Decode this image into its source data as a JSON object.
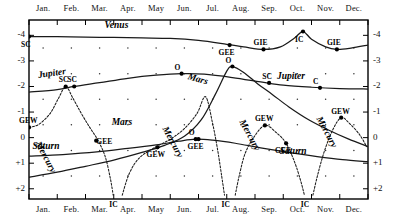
{
  "chart_data": {
    "type": "line",
    "title": "",
    "xlabel": "",
    "ylabel": "Magnitude",
    "ylim": [
      -4.6,
      2.4
    ],
    "yticks": [
      "-4",
      "-3",
      "-2",
      "-1",
      "0",
      "+1",
      "+2"
    ],
    "ytick_values": [
      -4,
      -3,
      -2,
      -1,
      0,
      1,
      2
    ],
    "grid": "dot-matrix",
    "legend": "inline-curve-labels",
    "x": [
      "Jan.",
      "Feb.",
      "Mar.",
      "Apr.",
      "May",
      "Jun.",
      "Jul.",
      "Aug.",
      "Sep.",
      "Oct.",
      "Nov.",
      "Dec."
    ],
    "series": [
      {
        "name": "Venus",
        "style": "solid",
        "points": [
          {
            "month": 1.0,
            "mag": -3.95
          },
          {
            "month": 2.0,
            "mag": -3.95
          },
          {
            "month": 3.0,
            "mag": -3.93
          },
          {
            "month": 4.0,
            "mag": -3.92
          },
          {
            "month": 5.0,
            "mag": -3.9
          },
          {
            "month": 6.0,
            "mag": -3.88
          },
          {
            "month": 7.0,
            "mag": -3.8
          },
          {
            "month": 8.0,
            "mag": -3.65
          },
          {
            "month": 8.6,
            "mag": -3.55
          },
          {
            "month": 9.3,
            "mag": -3.45
          },
          {
            "month": 9.9,
            "mag": -3.55
          },
          {
            "month": 10.4,
            "mag": -3.9
          },
          {
            "month": 10.7,
            "mag": -4.15
          },
          {
            "month": 11.0,
            "mag": -3.85
          },
          {
            "month": 11.5,
            "mag": -3.55
          },
          {
            "month": 11.9,
            "mag": -3.45
          },
          {
            "month": 12.4,
            "mag": -3.5
          },
          {
            "month": 13.0,
            "mag": -3.62
          }
        ],
        "events": [
          {
            "label": "SC",
            "month": 1.0,
            "mag": -3.95,
            "pos": "below"
          },
          {
            "label": "GEE",
            "month": 8.1,
            "mag": -3.62,
            "pos": "below"
          },
          {
            "label": "GIE",
            "month": 9.3,
            "mag": -3.45,
            "pos": "above"
          },
          {
            "label": "IC",
            "month": 10.7,
            "mag": -4.15,
            "pos": "below"
          },
          {
            "label": "GIE",
            "month": 11.9,
            "mag": -3.45,
            "pos": "above"
          }
        ]
      },
      {
        "name": "Jupiter",
        "style": "solid",
        "points": [
          {
            "month": 1.0,
            "mag": -1.78
          },
          {
            "month": 2.0,
            "mag": -1.88
          },
          {
            "month": 2.6,
            "mag": -2.0
          },
          {
            "month": 3.5,
            "mag": -2.15
          },
          {
            "month": 4.5,
            "mag": -2.32
          },
          {
            "month": 5.5,
            "mag": -2.44
          },
          {
            "month": 6.4,
            "mag": -2.5
          },
          {
            "month": 7.2,
            "mag": -2.48
          },
          {
            "month": 8.2,
            "mag": -2.35
          },
          {
            "month": 9.2,
            "mag": -2.18
          },
          {
            "month": 10.0,
            "mag": -2.05
          },
          {
            "month": 11.0,
            "mag": -1.97
          },
          {
            "month": 12.0,
            "mag": -1.92
          },
          {
            "month": 13.0,
            "mag": -1.9
          }
        ],
        "events": [
          {
            "label": "SC",
            "month": 2.6,
            "mag": -2.0,
            "pos": "above"
          },
          {
            "label": "O",
            "month": 6.4,
            "mag": -2.5,
            "pos": "above"
          },
          {
            "label": "SC",
            "month": 9.5,
            "mag": -2.14,
            "pos": "above"
          },
          {
            "label": "C",
            "month": 11.3,
            "mag": -1.95,
            "pos": "above"
          }
        ]
      },
      {
        "name": "Mars",
        "style": "solid",
        "points": [
          {
            "month": 1.0,
            "mag": 1.55
          },
          {
            "month": 2.0,
            "mag": 1.35
          },
          {
            "month": 3.0,
            "mag": 1.12
          },
          {
            "month": 4.0,
            "mag": 0.88
          },
          {
            "month": 5.0,
            "mag": 0.58
          },
          {
            "month": 5.8,
            "mag": 0.3
          },
          {
            "month": 6.5,
            "mag": -0.05
          },
          {
            "month": 7.1,
            "mag": -0.7
          },
          {
            "month": 7.6,
            "mag": -1.7
          },
          {
            "month": 8.0,
            "mag": -2.6
          },
          {
            "month": 8.2,
            "mag": -2.78
          },
          {
            "month": 8.6,
            "mag": -2.55
          },
          {
            "month": 9.1,
            "mag": -2.1
          },
          {
            "month": 9.6,
            "mag": -1.7
          },
          {
            "month": 10.2,
            "mag": -1.2
          },
          {
            "month": 10.9,
            "mag": -0.7
          },
          {
            "month": 11.6,
            "mag": -0.3
          },
          {
            "month": 12.3,
            "mag": 0.05
          },
          {
            "month": 13.0,
            "mag": 0.35
          }
        ],
        "events": [
          {
            "label": "O",
            "month": 8.2,
            "mag": -2.78,
            "pos": "above"
          }
        ]
      },
      {
        "name": "Saturn",
        "style": "solid",
        "points": [
          {
            "month": 1.0,
            "mag": 0.72
          },
          {
            "month": 2.2,
            "mag": 0.66
          },
          {
            "month": 3.4,
            "mag": 0.56
          },
          {
            "month": 4.5,
            "mag": 0.42
          },
          {
            "month": 5.5,
            "mag": 0.28
          },
          {
            "month": 6.3,
            "mag": 0.14
          },
          {
            "month": 6.9,
            "mag": 0.06
          },
          {
            "month": 7.5,
            "mag": 0.1
          },
          {
            "month": 8.3,
            "mag": 0.22
          },
          {
            "month": 9.2,
            "mag": 0.4
          },
          {
            "month": 10.2,
            "mag": 0.58
          },
          {
            "month": 11.2,
            "mag": 0.74
          },
          {
            "month": 12.1,
            "mag": 0.86
          },
          {
            "month": 13.0,
            "mag": 0.94
          }
        ],
        "events": [
          {
            "label": "O",
            "month": 6.9,
            "mag": 0.06,
            "pos": "above"
          }
        ]
      },
      {
        "name": "Mercury",
        "style": "dotted",
        "branches": [
          {
            "points": [
              {
                "month": 1.0,
                "mag": -0.4
              },
              {
                "month": 1.35,
                "mag": -0.52
              },
              {
                "month": 1.75,
                "mag": -0.95
              },
              {
                "month": 2.05,
                "mag": -1.55
              },
              {
                "month": 2.3,
                "mag": -2.0
              },
              {
                "month": 2.55,
                "mag": -1.55
              },
              {
                "month": 2.85,
                "mag": -0.95
              },
              {
                "month": 3.15,
                "mag": -0.4
              },
              {
                "month": 3.45,
                "mag": 0.12
              },
              {
                "month": 3.7,
                "mag": 0.75
              },
              {
                "month": 3.88,
                "mag": 1.6
              },
              {
                "month": 3.98,
                "mag": 2.25
              }
            ]
          },
          {
            "points": [
              {
                "month": 4.3,
                "mag": 2.25
              },
              {
                "month": 4.55,
                "mag": 1.4
              },
              {
                "month": 4.9,
                "mag": 0.8
              },
              {
                "month": 5.4,
                "mag": 0.42
              },
              {
                "month": 6.0,
                "mag": 0.06
              },
              {
                "month": 6.5,
                "mag": -0.35
              },
              {
                "month": 6.95,
                "mag": -0.95
              },
              {
                "month": 7.25,
                "mag": -1.6
              },
              {
                "month": 7.5,
                "mag": -0.55
              },
              {
                "month": 7.68,
                "mag": 0.5
              },
              {
                "month": 7.82,
                "mag": 1.5
              },
              {
                "month": 7.92,
                "mag": 2.25
              }
            ]
          },
          {
            "points": [
              {
                "month": 8.3,
                "mag": 2.25
              },
              {
                "month": 8.45,
                "mag": 1.45
              },
              {
                "month": 8.65,
                "mag": 0.62
              },
              {
                "month": 8.95,
                "mag": 0.0
              },
              {
                "month": 9.35,
                "mag": -0.48
              },
              {
                "month": 9.75,
                "mag": -0.2
              },
              {
                "month": 10.1,
                "mag": 0.22
              },
              {
                "month": 10.4,
                "mag": 0.95
              },
              {
                "month": 10.62,
                "mag": 1.7
              },
              {
                "month": 10.75,
                "mag": 2.25
              }
            ]
          },
          {
            "points": [
              {
                "month": 11.05,
                "mag": 2.25
              },
              {
                "month": 11.22,
                "mag": 1.45
              },
              {
                "month": 11.45,
                "mag": 0.55
              },
              {
                "month": 11.75,
                "mag": -0.3
              },
              {
                "month": 12.05,
                "mag": -0.78
              },
              {
                "month": 12.35,
                "mag": -0.55
              },
              {
                "month": 12.7,
                "mag": -0.12
              },
              {
                "month": 12.95,
                "mag": 0.35
              }
            ]
          }
        ],
        "events": [
          {
            "label": "GEW",
            "month": 1.0,
            "mag": -0.4,
            "pos": "above"
          },
          {
            "label": "SC",
            "month": 2.3,
            "mag": -2.0,
            "pos": "above"
          },
          {
            "label": "IC",
            "month": 4.12,
            "mag": 2.32,
            "pos": "below"
          },
          {
            "label": "GEE",
            "month": 3.38,
            "mag": 0.12,
            "pos": "right"
          },
          {
            "label": "GEW",
            "month": 5.55,
            "mag": 0.38,
            "pos": "below"
          },
          {
            "label": "IC",
            "month": 8.1,
            "mag": 2.32,
            "pos": "below"
          },
          {
            "label": "GEE",
            "month": 7.0,
            "mag": 0.06,
            "pos": "below"
          },
          {
            "label": "GEW",
            "month": 9.35,
            "mag": -0.48,
            "pos": "above"
          },
          {
            "label": "IC",
            "month": 10.9,
            "mag": 2.32,
            "pos": "below"
          },
          {
            "label": "GEE",
            "month": 10.1,
            "mag": 0.22,
            "pos": "below"
          },
          {
            "label": "GEW",
            "month": 12.05,
            "mag": -0.78,
            "pos": "above"
          }
        ]
      }
    ],
    "curve_labels": [
      {
        "text": "Venus",
        "month": 4.1,
        "mag": -4.38,
        "rot": 0
      },
      {
        "text": "Jupiter",
        "month": 1.75,
        "mag": -2.42,
        "rot": -8
      },
      {
        "text": "Jupiter",
        "month": 10.2,
        "mag": -2.36,
        "rot": 0
      },
      {
        "text": "Mars",
        "month": 4.35,
        "mag": -0.58,
        "rot": 0
      },
      {
        "text": "Mars",
        "month": 7.05,
        "mag": -2.38,
        "rot": 16
      },
      {
        "text": "Saturn",
        "month": 1.55,
        "mag": 0.38,
        "rot": 0
      },
      {
        "text": "Saturn",
        "month": 10.3,
        "mag": 0.55,
        "rot": 0
      },
      {
        "text": "Mercury",
        "month": 1.75,
        "mag": 0.2,
        "rot": 62
      },
      {
        "text": "Mercury",
        "month": 6.25,
        "mag": -0.38,
        "rot": 62
      },
      {
        "text": "Mercury",
        "month": 8.95,
        "mag": -0.66,
        "rot": 62
      },
      {
        "text": "Mercury",
        "month": 11.7,
        "mag": -0.78,
        "rot": 62
      }
    ]
  }
}
